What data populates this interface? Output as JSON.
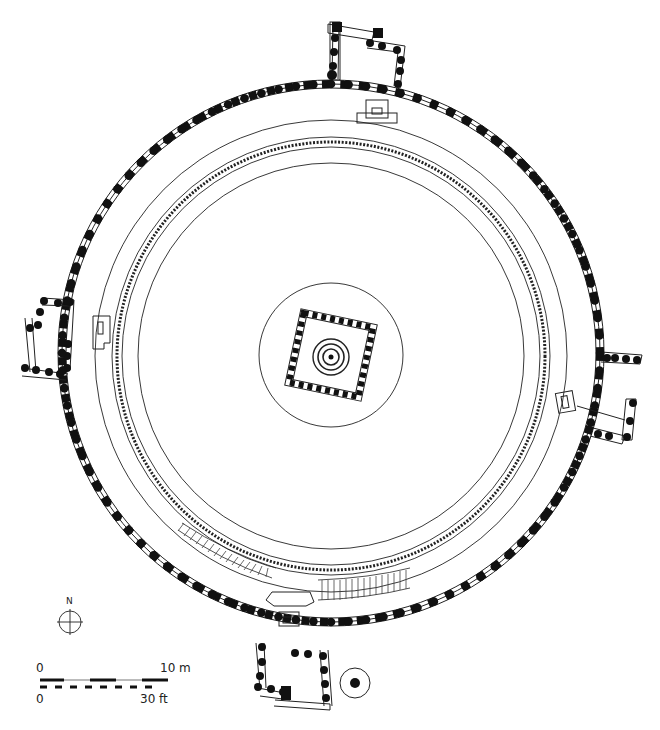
{
  "drawing": {
    "type": "architectural-plan",
    "subject": "circular shrine plan with central square chamber",
    "stroke_color": "#222222",
    "pillar_color": "#111111",
    "background": "#ffffff"
  },
  "compass": {
    "label": "N",
    "icon": "north-arrow-icon"
  },
  "scale_bar": {
    "metric_start": "0",
    "metric_end": "10 m",
    "imperial_start": "0",
    "imperial_end": "30 ft"
  }
}
